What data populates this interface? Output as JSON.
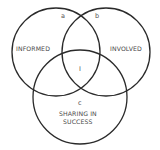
{
  "diagram": {
    "type": "venn",
    "sets": [
      {
        "id": "informed",
        "label": "INFORMED"
      },
      {
        "id": "involved",
        "label": "INVOLVED"
      },
      {
        "id": "sharing",
        "label_line1": "SHARING IN",
        "label_line2": "SUCCESS"
      }
    ],
    "region_labels": {
      "a": "a",
      "b": "b",
      "c": "c",
      "center": "I"
    },
    "stroke_color": "#2a2a2a",
    "background": "#ffffff"
  }
}
